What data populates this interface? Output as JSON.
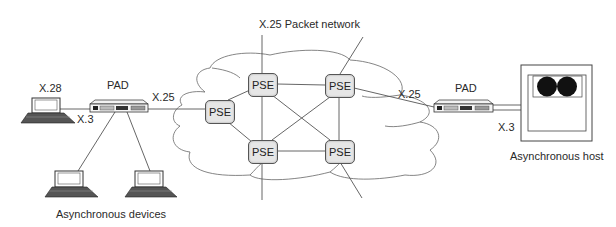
{
  "title": "X.25 Packet network",
  "nodes": {
    "pse_left": {
      "label": "PSE"
    },
    "pse_top_left": {
      "label": "PSE"
    },
    "pse_top_right": {
      "label": "PSE"
    },
    "pse_bottom_left": {
      "label": "PSE"
    },
    "pse_bottom_right": {
      "label": "PSE"
    },
    "pad_left": {
      "label": "PAD"
    },
    "pad_right": {
      "label": "PAD"
    }
  },
  "links": {
    "left_terminal_protocol": "X.28",
    "left_pad_terminal": "X.3",
    "left_pad_network": "X.25",
    "right_pad_network": "X.25",
    "right_pad_host": "X.3"
  },
  "captions": {
    "devices": "Asynchronous devices",
    "host": "Asynchronous host"
  },
  "colors": {
    "line": "#555555",
    "pse_fill": "#e6e6e6",
    "disk": "#111111"
  }
}
